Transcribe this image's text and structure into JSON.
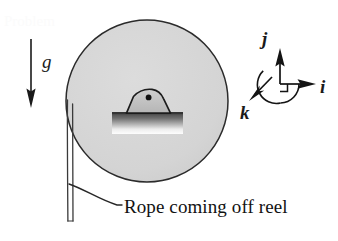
{
  "figure": {
    "title": "Rope coming off reel",
    "caption": "Rope coming off reel",
    "background_color": "#ffffff"
  },
  "reel": {
    "label": "reel-disc",
    "center_x": 147,
    "center_y": 101,
    "radius": 81,
    "fill_color": "#d4d4d4",
    "stroke_color": "#2b2b2b",
    "stroke_width": 1.4
  },
  "hub": {
    "label": "axle-bracket",
    "axle_dot_color": "#111111",
    "bracket_stroke_color": "#1c1c1c",
    "bracket_fill_color": "#c2c2c2",
    "bar_color": "#4a4a4a",
    "highlight_color": "#fdfdfd"
  },
  "rope": {
    "label": "rope-ribbon",
    "stroke_color": "#3a3a3a",
    "stroke_width": 1.3,
    "top_y": 101,
    "bottom_y": 222,
    "left_x": 68,
    "right_x": 73
  },
  "gravity": {
    "label": "g",
    "arrow_color": "#1a1a1a",
    "arrow_x": 31,
    "arrow_top_y": 39,
    "arrow_bottom_y": 107
  },
  "coordinate_frame": {
    "origin_x": 280,
    "origin_y": 84,
    "axes": [
      {
        "name": "j",
        "label": "j",
        "direction": "up"
      },
      {
        "name": "i",
        "label": "i",
        "direction": "right"
      },
      {
        "name": "k",
        "label": "k",
        "direction": "down-left"
      }
    ],
    "arc": {
      "name": "rotation-arc",
      "radius": 19
    },
    "right_angle_marker": {
      "size": 7
    },
    "stroke_color": "#141414"
  },
  "leader_line": {
    "label": "caption-leader",
    "stroke_color": "#262626",
    "stroke_width": 1.3
  },
  "watermark": {
    "text": "Problem",
    "color": "#fbfbfb"
  },
  "icons": {
    "arrow_down": "arrow-down-icon",
    "arrow_up": "arrow-up-icon",
    "arrow_right": "arrow-right-icon",
    "arrow_diagonal": "arrow-down-left-icon",
    "arc": "arc-icon"
  }
}
